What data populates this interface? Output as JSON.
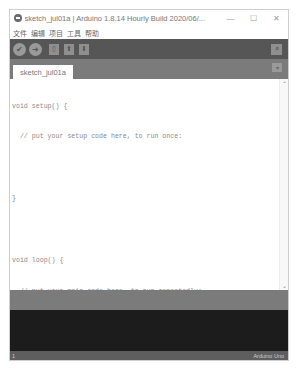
{
  "window": {
    "title": "sketch_jul01a | Arduino 1.8.14 Hourly Build 2020/06/...",
    "controls": {
      "minimize": "—",
      "maximize": "☐",
      "close": "✕"
    }
  },
  "menubar": {
    "items": [
      {
        "label": "文件"
      },
      {
        "label": "编辑"
      },
      {
        "label": "项目"
      },
      {
        "label": "工具"
      },
      {
        "label": "帮助"
      }
    ]
  },
  "toolbar": {
    "verify_icon": "✔",
    "upload_icon": "➜",
    "new_icon": "▯",
    "open_icon": "⬆",
    "save_icon": "⬇",
    "serial_monitor_icon": "⌕"
  },
  "tabs": {
    "items": [
      {
        "label": "sketch_jul01a"
      }
    ],
    "menu_icon": "▾"
  },
  "editor": {
    "lines": [
      "void setup() {",
      "  // put your setup code here, to run once:",
      "",
      "}",
      "",
      "void loop() {",
      "  // put your main code here, to run repeatedly:",
      "",
      "}"
    ],
    "scroll_up": "⌃",
    "scroll_down": "⌄"
  },
  "status": {
    "line_number": "1",
    "board": "Arduino Uno"
  }
}
